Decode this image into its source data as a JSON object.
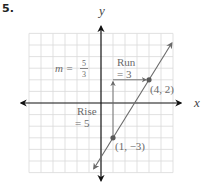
{
  "problem_number": "5.",
  "chart_data": {
    "type": "line",
    "title": "",
    "xlabel": "x",
    "ylabel": "y",
    "xlim": [
      -6,
      6
    ],
    "ylim": [
      -6,
      6
    ],
    "grid": true,
    "grid_step": 1,
    "line": {
      "equation": "y = (5/3)x - 14/3",
      "slope": "5/3",
      "x_range": [
        -0.6,
        5.9
      ]
    },
    "points": [
      {
        "x": 4,
        "y": 2,
        "label": "(4, 2)"
      },
      {
        "x": 1,
        "y": -3,
        "label": "(1, −3)"
      }
    ],
    "rise": {
      "from": [
        1,
        -3
      ],
      "to": [
        1,
        2
      ],
      "value": 5,
      "label_line1": "Rise",
      "label_line2": "= 5"
    },
    "run": {
      "from": [
        1,
        2
      ],
      "to": [
        4,
        2
      ],
      "value": 3,
      "label_line1": "Run",
      "label_line2": "= 3"
    },
    "slope_label": {
      "prefix": "m =",
      "numerator": "5",
      "denominator": "3"
    }
  },
  "colors": {
    "axis": "#111111",
    "grid": "#d9d9d9",
    "line": "#6a6a6a",
    "point": "#5a5a5a",
    "label": "#6a6a6a"
  }
}
